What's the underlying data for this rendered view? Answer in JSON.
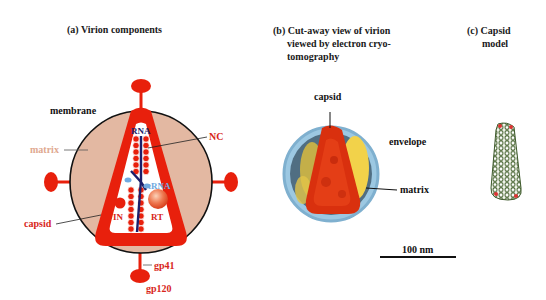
{
  "panels": {
    "a": {
      "title": "(a) Virion components",
      "labels": {
        "membrane": "membrane",
        "matrix": "matrix",
        "nc": "NC",
        "rna": "RNA",
        "trna": "tRNA",
        "in": "IN",
        "rt": "RT",
        "capsid": "capsid",
        "gp41": "gp41",
        "gp120": "gp120"
      }
    },
    "b": {
      "title_lines": [
        "(b) Cut-away view of virion",
        "viewed by electron cryo-",
        "tomography"
      ],
      "labels": {
        "capsid": "capsid",
        "envelope": "envelope",
        "matrix": "matrix"
      },
      "scale_bar": "100 nm"
    },
    "c": {
      "title_lines": [
        "(c) Capsid",
        "model"
      ]
    }
  },
  "colors": {
    "red": "#e8200c",
    "matrix_fill": "#e3b8a2",
    "membrane": "#111111",
    "rna": "#1c1f6b",
    "trna": "#6fa9e0",
    "label_red": "#d8261a",
    "label_matrix": "#e0a890",
    "envelope_blue": "#9cc8e2",
    "matrix_yellow": "#f2d24a",
    "capsid_green": "#4f6b3a"
  }
}
